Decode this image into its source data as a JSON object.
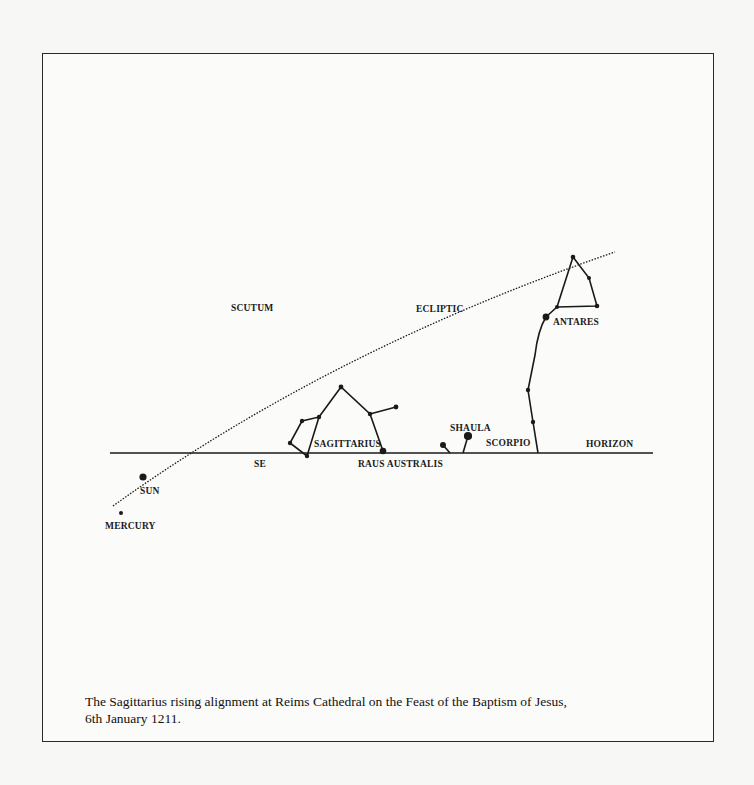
{
  "figure": {
    "caption_line1": "The Sagittarius rising alignment at Reims Cathedral on the Feast of the Baptism of Jesus,",
    "caption_line2": "6th January 1211."
  },
  "labels": {
    "scutum": "SCUTUM",
    "ecliptic": "ECLIPTIC",
    "antares": "ANTARES",
    "sagittarius": "SAGITTARIUS",
    "shaula": "SHAULA",
    "scorpio": "SCORPIO",
    "horizon": "HORIZON",
    "se": "SE",
    "raus_australis": "RAUS AUSTRALIS",
    "sun": "SUN",
    "mercury": "MERCURY"
  },
  "colors": {
    "ink": "#1a1a1a",
    "paper": "#fbfbfa",
    "background": "#f7f7f5"
  }
}
